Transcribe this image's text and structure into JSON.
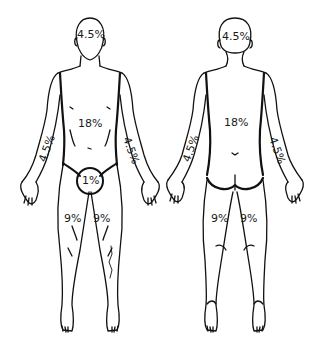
{
  "diagram": {
    "title": "",
    "colors": {
      "line": "#111111",
      "background": "#ffffff",
      "text": "#1a1a1a"
    },
    "front_view": {
      "head": "4.5%",
      "trunk": "18%",
      "left_arm": "4.5%",
      "right_arm": "4.5%",
      "genitals": "1%",
      "left_leg": "9%",
      "right_leg": "9%"
    },
    "back_view": {
      "head": "4.5%",
      "trunk": "18%",
      "left_arm": "4.5%",
      "right_arm": "4.5%",
      "left_leg": "9%",
      "right_leg": "9%"
    }
  }
}
